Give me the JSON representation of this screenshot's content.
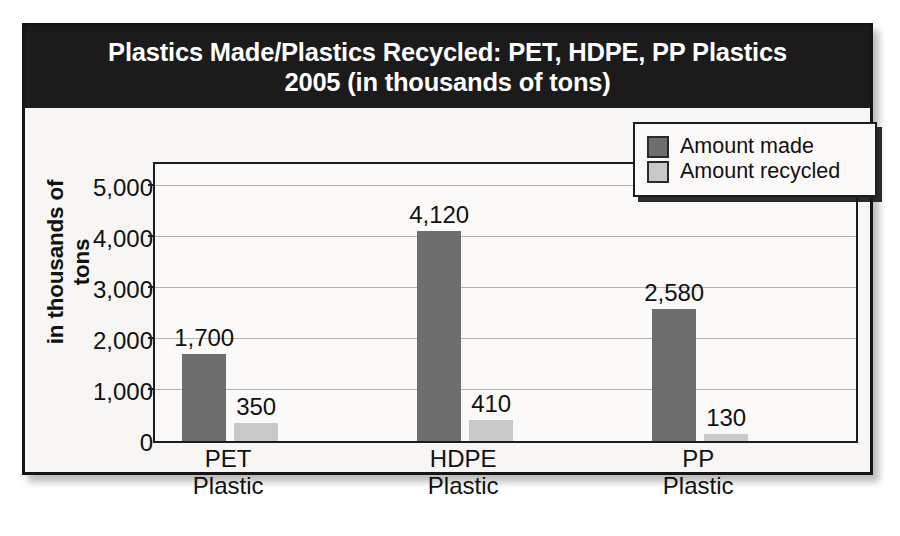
{
  "chart_data": {
    "type": "bar",
    "title": "Plastics Made/Plastics Recycled: PET, HDPE, PP Plastics\n2005 (in thousands of tons)",
    "title_line1": "Plastics Made/Plastics Recycled: PET, HDPE, PP Plastics",
    "title_line2": "2005 (in thousands of tons)",
    "xlabel": "",
    "ylabel": "in thousands of tons",
    "categories": [
      "PET\nPlastic",
      "HDPE\nPlastic",
      "PP\nPlastic"
    ],
    "category_names": [
      "PET Plastic",
      "HDPE Plastic",
      "PP Plastic"
    ],
    "series": [
      {
        "name": "Amount made",
        "color": "#6e6e6e",
        "values": [
          1700,
          4120,
          2580
        ],
        "value_labels": [
          "1,700",
          "4,120",
          "2,580"
        ]
      },
      {
        "name": "Amount recycled",
        "color": "#c9c9c9",
        "values": [
          350,
          410,
          130
        ],
        "value_labels": [
          "350",
          "410",
          "130"
        ]
      }
    ],
    "ylim": [
      0,
      5500
    ],
    "yticks": [
      0,
      1000,
      2000,
      3000,
      4000,
      5000
    ],
    "ytick_labels": [
      "0",
      "1,000",
      "2,000",
      "3,000",
      "4,000",
      "5,000"
    ],
    "grid": true,
    "legend_position": "top-right",
    "background_color": "#f7f6f4",
    "title_background": "#1b1b1b",
    "title_text_color": "#ffffff",
    "axis_color": "#1d1d1d",
    "gridline_color": "#b4b2af"
  }
}
